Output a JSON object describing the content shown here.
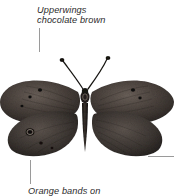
{
  "figure": {
    "background_color": "#ffffff"
  },
  "annotations": {
    "top": {
      "text": "Upperwings\nchocolate brown",
      "leader": "vertical-line-down"
    },
    "bottom": {
      "text": "Orange bands on",
      "leader": "vertical-line-up",
      "clipped": "true"
    },
    "right": {
      "text": "",
      "leader": "horizontal-line-right"
    }
  },
  "style": {
    "text_color": "#2b2b2b",
    "leader_color": "#9a9a9a",
    "wing_dark": "#2f2a27",
    "wing_mid": "#4a423c",
    "wing_light": "#6a605a",
    "body_color": "#231f1d"
  }
}
